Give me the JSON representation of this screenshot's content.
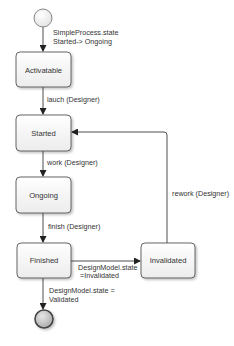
{
  "diagram": {
    "type": "state-machine",
    "states": [
      {
        "id": "activatable",
        "label": "Activatable"
      },
      {
        "id": "started",
        "label": "Started"
      },
      {
        "id": "ongoing",
        "label": "Ongoing"
      },
      {
        "id": "finished",
        "label": "Finished"
      },
      {
        "id": "invalidated",
        "label": "Invalidated"
      }
    ],
    "transitions": [
      {
        "id": "init",
        "from": "start",
        "to": "activatable",
        "label_lines": [
          "SimpleProcess.state",
          "Started-> Ongoing"
        ]
      },
      {
        "id": "lauch",
        "from": "activatable",
        "to": "started",
        "label_lines": [
          "lauch (Designer)"
        ]
      },
      {
        "id": "work",
        "from": "started",
        "to": "ongoing",
        "label_lines": [
          "work (Designer)"
        ]
      },
      {
        "id": "finish",
        "from": "ongoing",
        "to": "finished",
        "label_lines": [
          "finish (Designer)"
        ]
      },
      {
        "id": "invalidate",
        "from": "finished",
        "to": "invalidated",
        "label_lines": [
          "DesignModel.state",
          "=Invalidated"
        ]
      },
      {
        "id": "rework",
        "from": "invalidated",
        "to": "started",
        "label_lines": [
          "rework (Designer)"
        ]
      },
      {
        "id": "validate",
        "from": "finished",
        "to": "end",
        "label_lines": [
          "DesignModel.state =",
          "Validated"
        ]
      }
    ],
    "colors": {
      "line": "#3a3a3a",
      "box_stroke": "#555555",
      "box_fill_top": "#ffffff",
      "box_fill_bottom": "#eeeeee",
      "end_fill": "#bdbdbd"
    }
  }
}
